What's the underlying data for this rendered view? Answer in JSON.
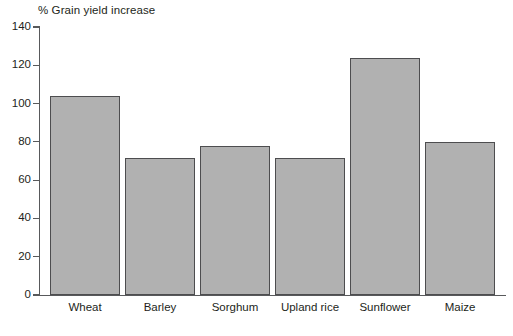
{
  "chart_data": {
    "type": "bar",
    "title": "% Grain yield increase",
    "xlabel": "",
    "ylabel": "",
    "ylim": [
      0,
      140
    ],
    "yticks": [
      0,
      20,
      40,
      60,
      80,
      100,
      120,
      140
    ],
    "grid": false,
    "legend": null,
    "categories": [
      "Wheat",
      "Barley",
      "Sorghum",
      "Upland rice",
      "Sunflower",
      "Maize"
    ],
    "values": [
      104,
      71.5,
      78,
      71.5,
      124,
      80
    ],
    "bar_fill_color": "#b1b1b1",
    "bar_border_color": "#4d4d4f",
    "axis_color": "#58595b",
    "text_color": "#231f20",
    "background_color": "#ffffff"
  },
  "axis": {
    "y_tick_labels": [
      "140",
      "120",
      "100",
      "80",
      "60",
      "40",
      "20",
      "0"
    ]
  },
  "bars": [
    {
      "label": "Wheat",
      "value": 104
    },
    {
      "label": "Barley",
      "value": 71.5
    },
    {
      "label": "Sorghum",
      "value": 78
    },
    {
      "label": "Upland rice",
      "value": 71.5
    },
    {
      "label": "Sunflower",
      "value": 124
    },
    {
      "label": "Maize",
      "value": 80
    }
  ]
}
